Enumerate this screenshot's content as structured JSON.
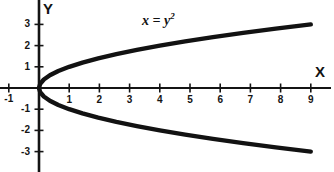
{
  "figure": {
    "background_color": "#ffffff",
    "ink_color": "#121212"
  },
  "axes": {
    "x_axis_name": "X",
    "y_axis_name": "Y",
    "origin_px": {
      "x": 39,
      "y": 88
    },
    "x_unit_px": 30.2,
    "y_unit_px": 21.2,
    "x_tick_labels": [
      "-1",
      "1",
      "2",
      "3",
      "4",
      "5",
      "6",
      "7",
      "8",
      "9"
    ],
    "x_tick_values": [
      -1,
      1,
      2,
      3,
      4,
      5,
      6,
      7,
      8,
      9
    ],
    "y_tick_labels": [
      "3",
      "2",
      "1",
      "-1",
      "-2",
      "-3"
    ],
    "y_tick_values": [
      3,
      2,
      1,
      -1,
      -2,
      -3
    ]
  },
  "annotation": {
    "equation_lhs": "x",
    "equation_eq": " = ",
    "equation_base": "y",
    "equation_exponent": "2",
    "equation_text": "x = y2"
  },
  "chart_data": {
    "type": "line",
    "title": "",
    "subtitle": "",
    "xlabel": "X",
    "ylabel": "Y",
    "grid": false,
    "legend_position": "none",
    "xlim": [
      -1.3,
      9.8
    ],
    "ylim": [
      -3.9,
      4.1
    ],
    "annotations": [
      {
        "text": "x = y^2",
        "x": 3.4,
        "y": 3.4
      }
    ],
    "series": [
      {
        "name": "x = y^2 (upper branch)",
        "equation": "x = y^2, y >= 0",
        "x": [
          0,
          0.04,
          0.16,
          0.36,
          0.64,
          1,
          1.44,
          1.96,
          2.56,
          3.24,
          4,
          4.84,
          5.76,
          6.76,
          7.84,
          9
        ],
        "y": [
          0,
          0.2,
          0.4,
          0.6,
          0.8,
          1,
          1.2,
          1.4,
          1.6,
          1.8,
          2,
          2.2,
          2.4,
          2.6,
          2.8,
          3
        ]
      },
      {
        "name": "x = y^2 (lower branch)",
        "equation": "x = y^2, y <= 0",
        "x": [
          0,
          0.04,
          0.16,
          0.36,
          0.64,
          1,
          1.44,
          1.96,
          2.56,
          3.24,
          4,
          4.84,
          5.76,
          6.76,
          7.84,
          9
        ],
        "y": [
          0,
          -0.2,
          -0.4,
          -0.6,
          -0.8,
          -1,
          -1.2,
          -1.4,
          -1.6,
          -1.8,
          -2,
          -2.2,
          -2.4,
          -2.6,
          -2.8,
          -3
        ]
      }
    ]
  }
}
